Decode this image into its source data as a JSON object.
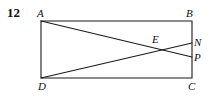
{
  "problem": {
    "number": "12"
  },
  "figure": {
    "type": "geometry-diagram",
    "shape": "rectangle",
    "stroke_color": "#1a1a1a",
    "background_color": "#ffffff",
    "stroke_width": 1.1,
    "vertices": {
      "A": {
        "label": "A",
        "x": 41,
        "y": 21
      },
      "B": {
        "label": "B",
        "x": 192,
        "y": 21
      },
      "C": {
        "label": "C",
        "x": 192,
        "y": 78
      },
      "D": {
        "label": "D",
        "x": 41,
        "y": 78
      },
      "E": {
        "label": "E",
        "x": 158,
        "y": 48
      },
      "N": {
        "label": "N",
        "x": 192,
        "y": 43
      },
      "P": {
        "label": "P",
        "x": 192,
        "y": 57
      }
    },
    "rectangle_sides": [
      {
        "name": "AB",
        "from": "A",
        "to": "B"
      },
      {
        "name": "BC",
        "from": "B",
        "to": "C"
      },
      {
        "name": "CD",
        "from": "C",
        "to": "D"
      },
      {
        "name": "DA",
        "from": "D",
        "to": "A"
      }
    ],
    "segments": [
      {
        "name": "AP",
        "from": "A",
        "to": "P"
      },
      {
        "name": "DN",
        "from": "D",
        "to": "N"
      }
    ],
    "intersection": {
      "name": "E",
      "of": [
        "AP",
        "DN"
      ]
    }
  }
}
